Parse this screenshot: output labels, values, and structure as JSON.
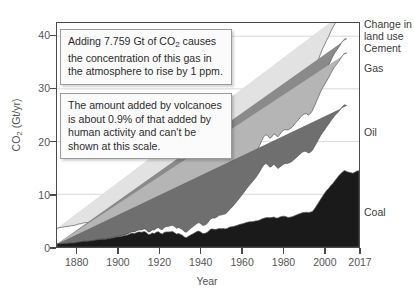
{
  "chart_data": {
    "type": "area",
    "title": "",
    "xlabel": "Year",
    "ylabel": "CO2 (Gt/yr)",
    "ylabel_parts": {
      "prefix": "CO",
      "sub": "2",
      "suffix": " (Gt/yr)"
    },
    "xlim": [
      1870,
      2017
    ],
    "ylim": [
      0,
      42.5
    ],
    "grid": true,
    "legend_position": "right-of-plot",
    "stacked": true,
    "y_ticks": [
      0,
      10,
      20,
      30,
      40
    ],
    "x_ticks": [
      1880,
      1900,
      1920,
      1940,
      1960,
      1980,
      2000,
      2017
    ],
    "series": [
      {
        "name": "Coal",
        "color": "#1a1a1a",
        "label_y_value": 5.5,
        "values": [
          0.55,
          0.6,
          0.63,
          0.68,
          0.68,
          0.7,
          0.75,
          0.77,
          0.78,
          0.83,
          0.92,
          0.96,
          1.02,
          1.08,
          1.09,
          1.1,
          1.14,
          1.19,
          1.23,
          1.33,
          1.4,
          1.44,
          1.47,
          1.45,
          1.48,
          1.56,
          1.6,
          1.71,
          1.75,
          1.88,
          1.95,
          1.97,
          2.03,
          2.18,
          2.19,
          2.32,
          2.48,
          2.68,
          2.57,
          2.68,
          2.83,
          2.83,
          2.8,
          2.96,
          2.77,
          2.37,
          2.4,
          2.64,
          2.55,
          2.8,
          2.9,
          2.61,
          2.47,
          2.79,
          2.86,
          2.85,
          2.88,
          2.94,
          2.72,
          2.45,
          2.54,
          2.39,
          2.2,
          1.86,
          1.8,
          2.07,
          2.29,
          2.49,
          2.72,
          2.92,
          3.03,
          2.8,
          2.54,
          2.59,
          2.73,
          3.1,
          3.4,
          3.4,
          3.3,
          3.4,
          3.51,
          3.48,
          3.5,
          3.43,
          3.53,
          3.75,
          3.82,
          3.9,
          4.0,
          4.12,
          4.25,
          4.35,
          4.45,
          4.58,
          4.7,
          4.78,
          4.8,
          4.85,
          4.95,
          5.0,
          5.1,
          5.3,
          5.45,
          5.55,
          5.6,
          5.55,
          5.6,
          5.7,
          5.5,
          5.5,
          5.7,
          5.8,
          5.85,
          5.75,
          5.6,
          5.65,
          5.75,
          5.9,
          6.05,
          6.2,
          6.35,
          6.5,
          6.55,
          6.6,
          6.55,
          6.6,
          6.75,
          7.2,
          7.8,
          8.4,
          9.0,
          9.6,
          10.2,
          10.7,
          11.1,
          11.6,
          12.0,
          12.5,
          13.0,
          13.5,
          13.9,
          14.3,
          14.5,
          14.3,
          14.2,
          14.1,
          14.0,
          14.2,
          14.4,
          14.45
        ]
      },
      {
        "name": "Oil",
        "color": "#6f6f6f",
        "label_y_value": 18.5,
        "values": [
          0,
          0,
          0,
          0,
          0,
          0,
          0,
          0,
          0,
          0,
          0.02,
          0.02,
          0.02,
          0.03,
          0.03,
          0.03,
          0.04,
          0.04,
          0.05,
          0.05,
          0.06,
          0.06,
          0.07,
          0.07,
          0.08,
          0.09,
          0.1,
          0.11,
          0.12,
          0.13,
          0.15,
          0.16,
          0.18,
          0.2,
          0.22,
          0.24,
          0.27,
          0.3,
          0.33,
          0.36,
          0.4,
          0.43,
          0.47,
          0.51,
          0.53,
          0.5,
          0.55,
          0.62,
          0.68,
          0.74,
          0.8,
          0.78,
          0.85,
          0.95,
          1.02,
          1.08,
          1.15,
          1.2,
          1.18,
          1.1,
          1.15,
          1.12,
          1.08,
          1.0,
          1.05,
          1.15,
          1.25,
          1.35,
          1.45,
          1.55,
          1.6,
          1.6,
          1.55,
          1.6,
          1.7,
          1.85,
          2.0,
          2.1,
          2.2,
          2.35,
          2.5,
          2.6,
          2.7,
          2.85,
          3.05,
          3.3,
          3.6,
          3.95,
          4.3,
          4.65,
          5.0,
          5.4,
          5.8,
          6.2,
          6.6,
          7.0,
          7.4,
          7.8,
          8.2,
          8.7,
          9.2,
          9.7,
          10.1,
          10.3,
          10.0,
          9.6,
          9.7,
          10.0,
          9.8,
          9.4,
          9.5,
          9.7,
          9.9,
          10.1,
          10.3,
          10.4,
          10.5,
          10.7,
          10.9,
          11.1,
          11.3,
          11.5,
          11.6,
          11.5,
          11.3,
          11.4,
          11.6,
          11.8,
          11.9,
          12.0,
          12.1,
          12.1,
          12.0,
          12.1,
          12.2,
          12.3,
          12.4,
          12.4,
          12.3,
          12.2,
          12.3,
          12.4,
          12.5,
          12.5
        ]
      },
      {
        "name": "Gas",
        "color": "#b5b5b5",
        "label_y_value": 28.5,
        "values": [
          0,
          0,
          0,
          0,
          0,
          0,
          0,
          0,
          0,
          0,
          0,
          0,
          0,
          0,
          0,
          0,
          0,
          0,
          0,
          0,
          0.01,
          0.01,
          0.01,
          0.01,
          0.01,
          0.02,
          0.02,
          0.02,
          0.02,
          0.03,
          0.03,
          0.03,
          0.04,
          0.04,
          0.05,
          0.05,
          0.06,
          0.06,
          0.07,
          0.07,
          0.08,
          0.08,
          0.09,
          0.09,
          0.1,
          0.1,
          0.11,
          0.12,
          0.13,
          0.14,
          0.15,
          0.15,
          0.16,
          0.18,
          0.19,
          0.2,
          0.22,
          0.23,
          0.24,
          0.24,
          0.26,
          0.27,
          0.28,
          0.3,
          0.33,
          0.37,
          0.41,
          0.45,
          0.5,
          0.55,
          0.6,
          0.62,
          0.64,
          0.68,
          0.75,
          0.85,
          0.95,
          1.05,
          1.15,
          1.25,
          1.35,
          1.45,
          1.55,
          1.7,
          1.85,
          2.0,
          2.2,
          2.4,
          2.6,
          2.8,
          3.0,
          3.2,
          3.4,
          3.6,
          3.8,
          4.0,
          4.2,
          4.4,
          4.6,
          4.8,
          5.0,
          5.2,
          5.35,
          5.45,
          5.5,
          5.5,
          5.6,
          5.8,
          5.9,
          6.0,
          6.2,
          6.4,
          6.5,
          6.4,
          6.3,
          6.4,
          6.5,
          6.6,
          6.7,
          6.8,
          6.9,
          7.0,
          7.1,
          7.2,
          7.2,
          7.3,
          7.5,
          7.7,
          7.9,
          8.1,
          8.3,
          8.5,
          8.6,
          8.7,
          8.8,
          9.0,
          9.2,
          9.3,
          9.4,
          9.5,
          9.6,
          9.7,
          9.8,
          10.0,
          10.2
        ]
      },
      {
        "name": "Cement",
        "color": "#8a8a8a",
        "label_y_value": 36.5,
        "values": [
          0,
          0,
          0,
          0,
          0,
          0,
          0,
          0,
          0,
          0,
          0,
          0,
          0,
          0,
          0,
          0,
          0,
          0,
          0,
          0,
          0,
          0,
          0,
          0,
          0,
          0,
          0,
          0,
          0,
          0.01,
          0.01,
          0.01,
          0.01,
          0.01,
          0.01,
          0.02,
          0.02,
          0.02,
          0.02,
          0.02,
          0.03,
          0.03,
          0.03,
          0.03,
          0.03,
          0.03,
          0.04,
          0.04,
          0.04,
          0.05,
          0.05,
          0.05,
          0.05,
          0.06,
          0.06,
          0.06,
          0.07,
          0.07,
          0.07,
          0.07,
          0.08,
          0.08,
          0.08,
          0.08,
          0.09,
          0.09,
          0.1,
          0.1,
          0.11,
          0.11,
          0.12,
          0.12,
          0.12,
          0.13,
          0.14,
          0.15,
          0.16,
          0.17,
          0.18,
          0.19,
          0.2,
          0.21,
          0.22,
          0.24,
          0.26,
          0.28,
          0.3,
          0.32,
          0.34,
          0.36,
          0.38,
          0.4,
          0.42,
          0.44,
          0.46,
          0.48,
          0.5,
          0.52,
          0.54,
          0.56,
          0.58,
          0.6,
          0.62,
          0.63,
          0.64,
          0.65,
          0.67,
          0.68,
          0.69,
          0.71,
          0.73,
          0.75,
          0.76,
          0.78,
          0.8,
          0.82,
          0.85,
          0.88,
          0.92,
          0.96,
          1.0,
          1.05,
          1.08,
          1.1,
          1.12,
          1.15,
          1.2,
          1.3,
          1.45,
          1.6,
          1.75,
          1.9,
          2.05,
          2.2,
          2.3,
          2.4,
          2.5,
          2.6,
          2.65,
          2.7,
          2.72,
          2.7,
          2.68,
          2.7,
          2.72,
          2.75
        ]
      },
      {
        "name": "Change in land use",
        "color": "#e2e2e2",
        "label_y_value": 40.5,
        "values": [
          3.0,
          3.05,
          3.1,
          3.1,
          3.15,
          3.2,
          3.2,
          3.25,
          3.3,
          3.3,
          3.35,
          3.4,
          3.4,
          3.45,
          3.5,
          3.5,
          3.55,
          3.6,
          3.6,
          3.65,
          3.7,
          3.7,
          3.75,
          3.8,
          3.8,
          3.85,
          3.9,
          3.9,
          3.95,
          4.0,
          4.0,
          4.05,
          4.1,
          4.1,
          4.15,
          4.2,
          4.2,
          4.25,
          4.3,
          4.3,
          4.35,
          4.4,
          4.4,
          4.45,
          4.5,
          4.5,
          4.55,
          4.6,
          4.6,
          4.65,
          4.7,
          4.7,
          4.75,
          4.8,
          4.8,
          4.85,
          4.9,
          4.9,
          4.95,
          5.0,
          5.0,
          5.05,
          5.1,
          5.1,
          5.15,
          5.2,
          5.2,
          5.25,
          5.3,
          5.3,
          5.35,
          5.4,
          5.4,
          5.45,
          5.5,
          5.5,
          5.4,
          5.3,
          5.2,
          5.3,
          5.4,
          5.3,
          5.2,
          5.3,
          5.4,
          5.5,
          5.5,
          5.5,
          5.5,
          5.5,
          5.5,
          5.5,
          5.5,
          5.5,
          5.5,
          5.5,
          5.5,
          5.5,
          5.5,
          5.5,
          5.5,
          5.5,
          5.5,
          5.5,
          5.5,
          5.5,
          5.5,
          5.5,
          5.5,
          5.5,
          5.5,
          5.5,
          5.5,
          5.5,
          5.5,
          5.5,
          5.5,
          5.5,
          5.5,
          5.5,
          5.5,
          5.5,
          5.5,
          5.5,
          5.5,
          5.5,
          5.5,
          5.5,
          5.5,
          5.5,
          5.5,
          5.5,
          5.5,
          5.5,
          5.5,
          5.5,
          5.5,
          5.5,
          5.5,
          5.5,
          5.5,
          5.5,
          5.5,
          5.5,
          5.5,
          5.5,
          5.5
        ]
      }
    ],
    "annotations": [
      {
        "id": "ppm",
        "text": "Adding 7.759 Gt of CO2 causes the concentration of this gas in the atmosphere to rise by 1 ppm.",
        "lines": [
          "Adding 7.759 Gt of CO",
          "2",
          " causes",
          "the concentration of this gas in",
          "the atmosphere to rise by 1 ppm."
        ]
      },
      {
        "id": "volcano",
        "text": "The amount added by volcanoes is about 0.9% of that added by human activity and can't be shown at this scale.",
        "lines": [
          "The amount added by volcanoes",
          "is about 0.9% of that added by",
          "human activity and can't be",
          "shown at this scale."
        ]
      }
    ]
  },
  "axes": {
    "y_title_prefix": "CO",
    "y_title_sub": "2",
    "y_title_suffix": " (Gt/yr)",
    "x_title": "Year",
    "y_tick_labels": [
      "40",
      "30",
      "20",
      "10",
      "0"
    ],
    "x_tick_labels": [
      "1880",
      "1900",
      "1920",
      "1940",
      "1960",
      "1980",
      "2000",
      "2017"
    ]
  },
  "series_labels": {
    "land_use_line1": "Change in",
    "land_use_line2": "land use",
    "cement": "Cement",
    "gas": "Gas",
    "oil": "Oil",
    "coal": "Coal"
  },
  "callouts": {
    "ppm_line1_a": "Adding 7.759 Gt of CO",
    "ppm_line1_sub": "2",
    "ppm_line1_b": " causes",
    "ppm_line2": "the concentration of this gas in",
    "ppm_line3": "the atmosphere to rise by 1 ppm.",
    "volcano_line1": "The amount added by volcanoes",
    "volcano_line2": "is about 0.9% of that added by",
    "volcano_line3": "human activity and can't be",
    "volcano_line4": "shown at this scale."
  },
  "colors": {
    "coal": "#1a1a1a",
    "oil": "#6f6f6f",
    "gas": "#b5b5b5",
    "cement": "#8a8a8a",
    "land_use": "#e2e2e2",
    "axis": "#4a4a4a",
    "grid": "#d8d8d8",
    "text": "#3a3a3a"
  }
}
